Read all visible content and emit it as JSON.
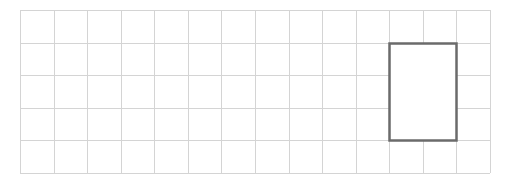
{
  "grid": {
    "origin_x": 20,
    "origin_y": 10,
    "columns": 14,
    "rows": 5,
    "cell_width": 33.57,
    "cell_height": 32.6,
    "line_color": "#d4d4d4",
    "line_width": 1
  },
  "highlight_rectangle": {
    "start_column": 11,
    "start_row": 1,
    "width_in_cells": 2,
    "height_in_cells": 3,
    "stroke_color": "#6b6b6b",
    "stroke_width": 2.5,
    "fill": "#ffffff"
  }
}
